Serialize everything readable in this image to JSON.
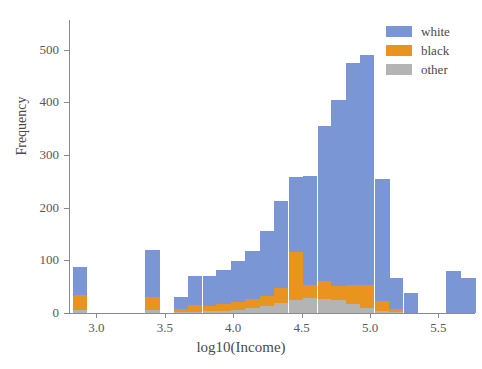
{
  "chart_data": {
    "type": "bar",
    "subtype": "stacked-histogram",
    "title": "",
    "xlabel": "log10(Income)",
    "ylabel": "Frequency",
    "xlim": [
      2.8,
      5.76
    ],
    "ylim": [
      0,
      556
    ],
    "grid": false,
    "bin_width": 0.105,
    "legend": {
      "position": "top-right",
      "entries": [
        {
          "name": "white",
          "color": "#7b96d4"
        },
        {
          "name": "black",
          "color": "#e8941f"
        },
        {
          "name": "other",
          "color": "#b4b4b4"
        }
      ]
    },
    "xticks": [
      3.0,
      3.5,
      4.0,
      4.5,
      5.0,
      5.5
    ],
    "xtick_labels": [
      "3.0",
      "3.5",
      "4.0",
      "4.5",
      "5.0",
      "5.5"
    ],
    "yticks": [
      0,
      100,
      200,
      300,
      400,
      500
    ],
    "ytick_labels": [
      "0",
      "100",
      "200",
      "300",
      "400",
      "500"
    ],
    "bin_centers": [
      2.88,
      2.99,
      3.09,
      3.2,
      3.3,
      3.41,
      3.51,
      3.62,
      3.72,
      3.83,
      3.93,
      4.04,
      4.14,
      4.25,
      4.35,
      4.46,
      4.56,
      4.67,
      4.77,
      4.88,
      4.98,
      5.09,
      5.19,
      5.3,
      5.4,
      5.51,
      5.61,
      5.72
    ],
    "series": [
      {
        "name": "other",
        "color": "#b4b4b4",
        "values": [
          5,
          0,
          0,
          0,
          0,
          6,
          0,
          2,
          2,
          3,
          4,
          6,
          9,
          13,
          19,
          24,
          28,
          26,
          24,
          18,
          10,
          4,
          2,
          0,
          0,
          0,
          0,
          0
        ]
      },
      {
        "name": "black",
        "color": "#e8941f",
        "values": [
          29,
          0,
          0,
          0,
          0,
          25,
          0,
          5,
          14,
          10,
          14,
          14,
          17,
          20,
          28,
          92,
          26,
          34,
          28,
          35,
          44,
          18,
          6,
          0,
          0,
          0,
          0,
          0
        ]
      },
      {
        "name": "white",
        "color": "#7b96d4",
        "values": [
          54,
          0,
          0,
          0,
          0,
          88,
          0,
          24,
          54,
          57,
          63,
          79,
          92,
          122,
          166,
          143,
          206,
          295,
          352,
          421,
          435,
          233,
          58,
          38,
          0,
          0,
          80,
          66
        ]
      }
    ],
    "bar_totals": [
      88,
      0,
      0,
      0,
      0,
      119,
      0,
      31,
      70,
      70,
      81,
      99,
      118,
      155,
      213,
      259,
      260,
      355,
      404,
      474,
      489,
      255,
      66,
      42,
      0,
      0,
      80,
      66
    ]
  }
}
